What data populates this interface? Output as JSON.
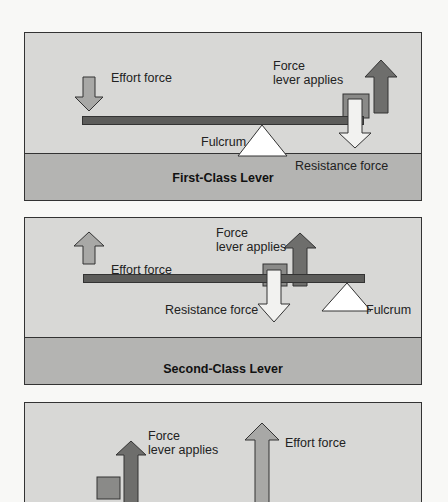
{
  "figure": {
    "panels": [
      {
        "title": "First-Class Lever",
        "labels": {
          "effort": "Effort force",
          "force_line1": "Force",
          "force_line2": "lever applies",
          "fulcrum": "Fulcrum",
          "resistance": "Resistance force"
        }
      },
      {
        "title": "Second-Class Lever",
        "labels": {
          "effort": "Effort force",
          "force_line1": "Force",
          "force_line2": "lever applies",
          "fulcrum": "Fulcrum",
          "resistance": "Resistance force"
        }
      },
      {
        "title": "",
        "labels": {
          "effort": "Effort force",
          "force_line1": "Force",
          "force_line2": "lever applies"
        }
      }
    ],
    "colors": {
      "panel_bg": "#d8d8d6",
      "ground_bg": "#b4b4b2",
      "lever": "#5c5c5a",
      "effort_arrow": "#a8a8a6",
      "force_arrow": "#6e6e6c",
      "resistance_arrow": "#f2f2f0",
      "fulcrum": "#ffffff"
    }
  }
}
